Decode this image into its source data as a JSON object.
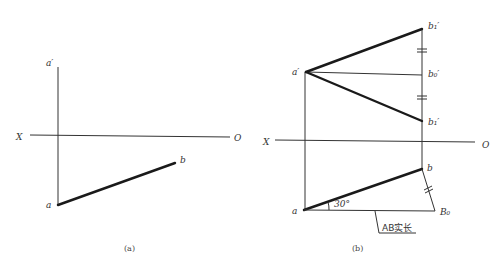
{
  "figure_a": {
    "caption": "(a)",
    "axis": {
      "left_label": "X",
      "right_label": "O"
    },
    "points": {
      "a_prime": "a′",
      "a": "a",
      "b": "b"
    }
  },
  "figure_b": {
    "caption": "(b)",
    "axis": {
      "left_label": "X",
      "right_label": "O"
    },
    "points": {
      "a_prime": "a′",
      "b1_prime_top": "b₁′",
      "b0_prime": "b₀′",
      "b1_prime_bottom": "b₁′",
      "a": "a",
      "b": "b",
      "B0": "B₀"
    },
    "angle_label": "30°",
    "true_length_label": "AB实长"
  }
}
